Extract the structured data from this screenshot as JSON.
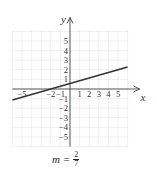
{
  "chart_data": {
    "type": "line",
    "title": "",
    "xlabel": "x",
    "ylabel": "y",
    "xlim": [
      -6,
      6
    ],
    "ylim": [
      -6,
      6
    ],
    "grid": true,
    "x_ticks_labeled": [
      -5,
      -2,
      -1,
      1,
      2,
      3,
      4,
      5
    ],
    "y_ticks_labeled": [
      5,
      4,
      3,
      2,
      1,
      -1,
      -2,
      -3,
      -4,
      -5
    ],
    "series": [
      {
        "name": "line",
        "equation": "y = (2/7)(x + 2)",
        "slope": "2/7",
        "x": [
          -6,
          6
        ],
        "y": [
          -1.14,
          2.29
        ]
      }
    ],
    "annotation": {
      "label": "m =",
      "numerator": "2",
      "denominator": "7"
    }
  }
}
